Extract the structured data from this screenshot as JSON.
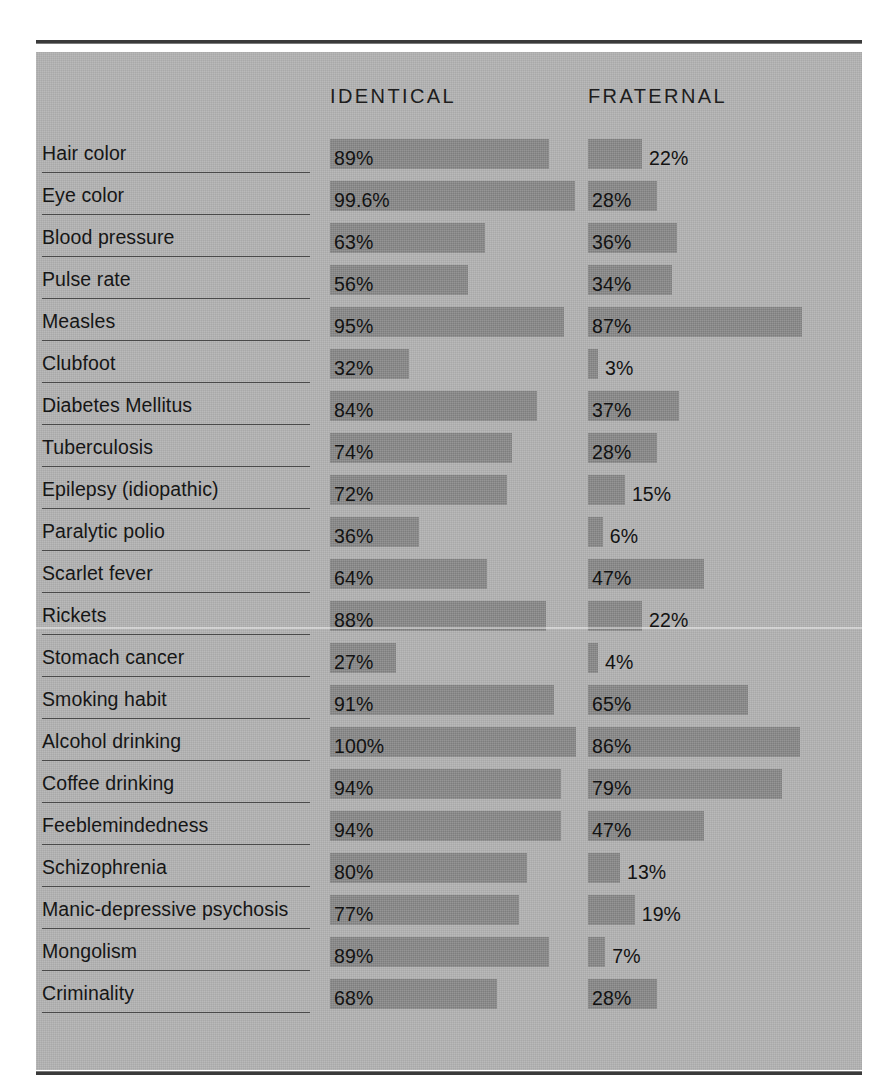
{
  "chart_data": {
    "type": "bar",
    "title": "",
    "subtitle": "",
    "orientation": "horizontal",
    "xlabel": "",
    "ylabel": "",
    "value_unit": "%",
    "xlim": [
      0,
      100
    ],
    "grid": false,
    "legend_position": "top-as-column-headers",
    "columns": [
      "IDENTICAL",
      "FRATERNAL"
    ],
    "categories": [
      "Hair color",
      "Eye color",
      "Blood pressure",
      "Pulse rate",
      "Measles",
      "Clubfoot",
      "Diabetes Mellitus",
      "Tuberculosis",
      "Epilepsy (idiopathic)",
      "Paralytic polio",
      "Scarlet fever",
      "Rickets",
      "Stomach cancer",
      "Smoking habit",
      "Alcohol drinking",
      "Coffee drinking",
      "Feeblemindedness",
      "Schizophrenia",
      "Manic-depressive psychosis",
      "Mongolism",
      "Criminality"
    ],
    "series": [
      {
        "name": "IDENTICAL",
        "values": [
          89,
          99.6,
          63,
          56,
          95,
          32,
          84,
          74,
          72,
          36,
          64,
          88,
          27,
          91,
          100,
          94,
          94,
          80,
          77,
          89,
          68
        ],
        "labels": [
          "89%",
          "99.6%",
          "63%",
          "56%",
          "95%",
          "32%",
          "84%",
          "74%",
          "72%",
          "36%",
          "64%",
          "88%",
          "27%",
          "91%",
          "100%",
          "94%",
          "94%",
          "80%",
          "77%",
          "89%",
          "68%"
        ]
      },
      {
        "name": "FRATERNAL",
        "values": [
          22,
          28,
          36,
          34,
          87,
          3,
          37,
          28,
          15,
          6,
          47,
          22,
          4,
          65,
          86,
          79,
          47,
          13,
          19,
          7,
          28
        ],
        "labels": [
          "22%",
          "28%",
          "36%",
          "34%",
          "87%",
          "3%",
          "37%",
          "28%",
          "15%",
          "6%",
          "47%",
          "22%",
          "4%",
          "65%",
          "86%",
          "79%",
          "47%",
          "13%",
          "19%",
          "7%",
          "28%"
        ]
      }
    ]
  },
  "style": {
    "panel_color": "#b4b4b4",
    "bar_color": "#8b8b8b",
    "text_color": "#161616",
    "rule_color": "#3a3a3a",
    "underline_color": "#4a4a4a"
  }
}
